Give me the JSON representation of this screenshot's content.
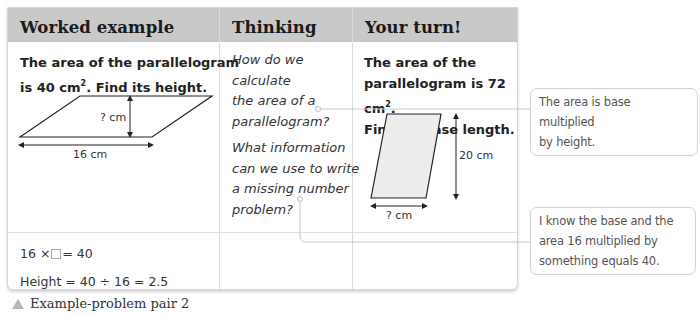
{
  "headers": {
    "worked_example": "Worked example",
    "thinking": "Thinking",
    "your_turn": "Your turn!"
  },
  "worked_example": {
    "question_line1": "The area of the parallelogram",
    "question_line2_pre": "is  40 cm",
    "question_line2_sup": "2",
    "question_line2_post": ". Find its height.",
    "diagram": {
      "height_label": "? cm",
      "base_label": "16 cm"
    },
    "working": {
      "line1_pre": "16 ×",
      "line1_post": "= 40",
      "line2": "Height = 40 ÷ 16 = 2.5"
    }
  },
  "thinking": {
    "q1_lines": [
      "How do we",
      "calculate",
      "the area of a",
      "parallelogram?"
    ],
    "q2_lines": [
      "What information",
      "can we use to write",
      "a missing number",
      "problem?"
    ]
  },
  "your_turn": {
    "question_line1": "The area of the",
    "question_line2_pre": "parallelogram is  72 cm",
    "question_line2_sup": "2",
    "question_line2_post": ".",
    "question_line3": "Find its base length.",
    "diagram": {
      "height_label": "20 cm",
      "base_label": "? cm"
    }
  },
  "callouts": {
    "bubble1": [
      "The area is base multiplied",
      "by height."
    ],
    "bubble2": [
      "I know the base and the",
      "area 16 multiplied by",
      "something equals 40."
    ]
  },
  "caption": "Example-problem pair 2",
  "colors": {
    "header_bg": "#c9c9c9",
    "border": "#d6d6d6",
    "caption_triangle": "#b8b8b8",
    "shape_fill": "#ececec"
  }
}
